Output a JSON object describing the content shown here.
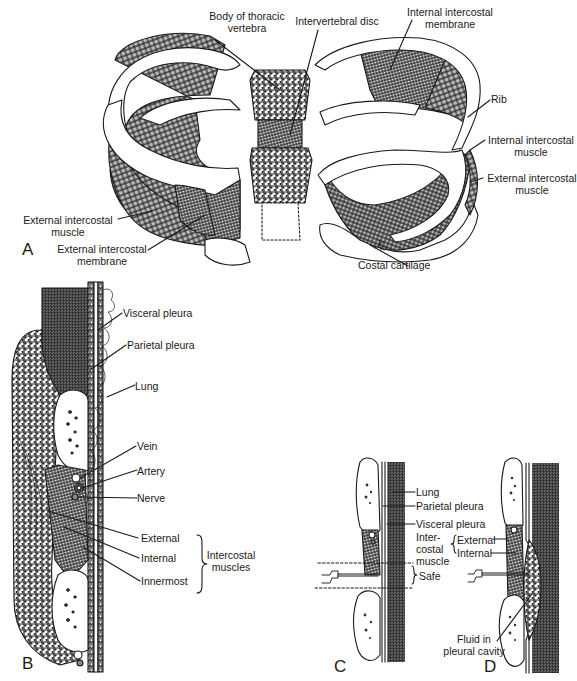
{
  "figure": {
    "colors": {
      "shade": "#b9b9b9",
      "line": "#1a1a1a",
      "lung_shade": "#c8c8c8"
    },
    "panels": {
      "A": {
        "letter": "A",
        "labels": {
          "body_of_thoracic_vertebra_1": "Body of thoracic",
          "body_of_thoracic_vertebra_2": "vertebra",
          "intervertebral_disc": "Intervertebral disc",
          "internal_intercostal_membrane_1": "Internal intercostal",
          "internal_intercostal_membrane_2": "membrane",
          "rib": "Rib",
          "internal_intercostal_muscle_1": "Internal intercostal",
          "internal_intercostal_muscle_2": "muscle",
          "external_intercostal_muscle_right_1": "External intercostal",
          "external_intercostal_muscle_right_2": "muscle",
          "external_intercostal_muscle_left_1": "External intercostal",
          "external_intercostal_muscle_left_2": "muscle",
          "external_intercostal_membrane_1": "External intercostal",
          "external_intercostal_membrane_2": "membrane",
          "costal_cartilage": "Costal cartilage"
        }
      },
      "B": {
        "letter": "B",
        "labels": {
          "visceral_pleura": "Visceral pleura",
          "parietal_pleura": "Parietal pleura",
          "lung": "Lung",
          "vein": "Vein",
          "artery": "Artery",
          "nerve": "Nerve",
          "external": "External",
          "internal": "Internal",
          "innermost": "Innermost",
          "intercostal_muscles_1": "Intercostal",
          "intercostal_muscles_2": "muscles"
        }
      },
      "C": {
        "letter": "C",
        "labels": {
          "lung": "Lung",
          "parietal_pleura": "Parietal pleura",
          "visceral_pleura": "Visceral pleura",
          "intercostal_muscle_1": "Inter-",
          "intercostal_muscle_2": "costal",
          "intercostal_muscle_3": "muscle",
          "safe": "Safe"
        }
      },
      "D": {
        "letter": "D",
        "labels": {
          "external": "External",
          "internal": "Internal",
          "fluid_1": "Fluid in",
          "fluid_2": "pleural cavity"
        }
      }
    }
  }
}
